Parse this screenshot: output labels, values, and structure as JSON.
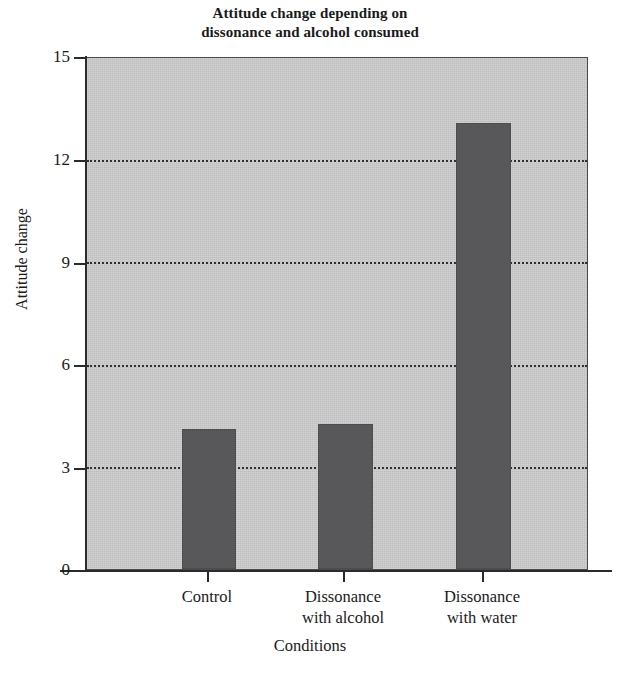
{
  "chart_data": {
    "type": "bar",
    "title": "Attitude change depending on dissonance and alcohol consumed",
    "title_lines": [
      "Attitude change depending on",
      "dissonance and alcohol consumed"
    ],
    "xlabel": "Conditions",
    "ylabel": "Attitude change",
    "categories": [
      "Control",
      "Dissonance with alcohol",
      "Dissonance with water"
    ],
    "category_lines": [
      [
        "Control",
        ""
      ],
      [
        "Dissonance",
        "with alcohol"
      ],
      [
        "Dissonance",
        "with water"
      ]
    ],
    "values": [
      4.1,
      4.25,
      13.1
    ],
    "ylim": [
      0,
      15
    ],
    "yticks": [
      0,
      3,
      6,
      9,
      12,
      15
    ],
    "ytick_labels": [
      "0",
      "3",
      "6",
      "9",
      "12",
      "15"
    ],
    "grid": true,
    "grid_style": "dotted-horizontal",
    "legend": "none",
    "bar_color": "#58585a",
    "plot_background": "#c9c9c9",
    "page_background": "#ffffff",
    "axis_color": "#2b2b2b"
  }
}
